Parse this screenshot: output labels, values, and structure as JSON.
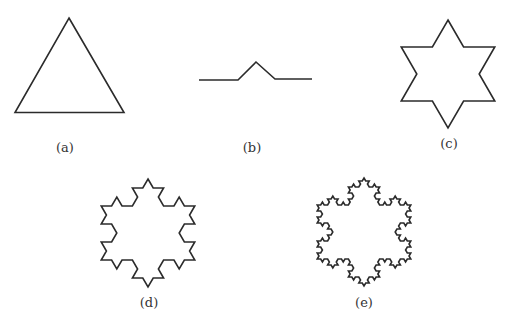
{
  "figure": {
    "stroke_color": "#2b2b2b",
    "background": "#ffffff",
    "panels": [
      {
        "id": "a",
        "label": "(a)",
        "kind": "koch-snowflake",
        "iterations": 0,
        "description": "equilateral triangle",
        "vertices": [
          [
            69,
            18
          ],
          [
            124,
            112.5
          ],
          [
            15,
            112.5
          ]
        ],
        "label_pos": [
          65,
          140
        ]
      },
      {
        "id": "b",
        "label": "(b)",
        "kind": "koch-generator",
        "description": "Koch generator segment",
        "points": [
          [
            199,
            80
          ],
          [
            238,
            80
          ],
          [
            256,
            62
          ],
          [
            275,
            79
          ],
          [
            312,
            79
          ]
        ],
        "label_pos": [
          252,
          140
        ]
      },
      {
        "id": "c",
        "label": "(c)",
        "kind": "koch-snowflake",
        "iterations": 1,
        "description": "six-pointed star (1 iteration)",
        "center": [
          448,
          74
        ],
        "radius": 54,
        "label_pos": [
          449,
          136
        ]
      },
      {
        "id": "d",
        "label": "(d)",
        "kind": "koch-snowflake",
        "iterations": 2,
        "description": "snowflake after 2 iterations",
        "center": [
          148,
          233
        ],
        "radius": 54,
        "label_pos": [
          149,
          295
        ]
      },
      {
        "id": "e",
        "label": "(e)",
        "kind": "koch-snowflake",
        "iterations": 3,
        "description": "snowflake after 3 iterations",
        "center": [
          364,
          232
        ],
        "radius": 54,
        "label_pos": [
          364,
          295
        ]
      }
    ]
  }
}
